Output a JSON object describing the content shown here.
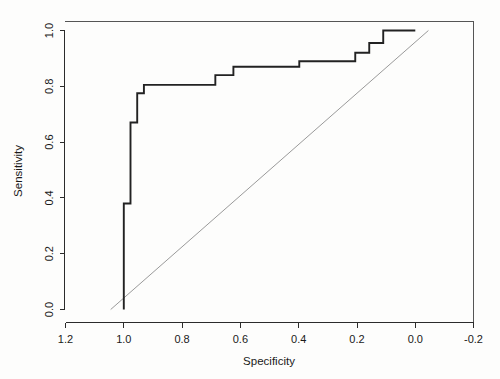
{
  "chart_data": {
    "type": "line",
    "title": "",
    "subtitle": "",
    "xlabel": "Specificity",
    "ylabel": "Sensitivity",
    "xlim": [
      1.3,
      -0.25
    ],
    "ylim": [
      -0.05,
      1.06
    ],
    "x_reversed": true,
    "grid": false,
    "legend": null,
    "legend_position": "none",
    "xticks": [
      "1.2",
      "1.0",
      "0.8",
      "0.6",
      "0.4",
      "0.2",
      "0.0",
      "-0.2"
    ],
    "xtick_values": [
      1.2,
      1.0,
      0.8,
      0.6,
      0.4,
      0.2,
      0.0,
      -0.2
    ],
    "yticks": [
      "0.0",
      "0.2",
      "0.4",
      "0.6",
      "0.8",
      "1.0"
    ],
    "ytick_values": [
      0.0,
      0.2,
      0.4,
      0.6,
      0.8,
      1.0
    ],
    "series": [
      {
        "name": "ROC curve",
        "style": "step",
        "color": "#222222",
        "points": [
          [
            1.0,
            0.0
          ],
          [
            1.0,
            0.38
          ],
          [
            0.977,
            0.38
          ],
          [
            0.977,
            0.67
          ],
          [
            0.977,
            0.67
          ],
          [
            0.954,
            0.67
          ],
          [
            0.954,
            0.775
          ],
          [
            0.931,
            0.775
          ],
          [
            0.931,
            0.805
          ],
          [
            0.88,
            0.805
          ],
          [
            0.88,
            0.805
          ],
          [
            0.686,
            0.805
          ],
          [
            0.686,
            0.84
          ],
          [
            0.624,
            0.84
          ],
          [
            0.624,
            0.87
          ],
          [
            0.398,
            0.87
          ],
          [
            0.398,
            0.89
          ],
          [
            0.206,
            0.89
          ],
          [
            0.206,
            0.92
          ],
          [
            0.158,
            0.92
          ],
          [
            0.158,
            0.955
          ],
          [
            0.11,
            0.955
          ],
          [
            0.11,
            1.0
          ],
          [
            0.0,
            1.0
          ]
        ]
      },
      {
        "name": "chance diagonal",
        "style": "line",
        "color": "#9a9a9a",
        "points": [
          [
            1.045,
            0.0
          ],
          [
            -0.045,
            1.0
          ]
        ]
      }
    ]
  },
  "axes": {
    "x_axis_title": "Specificity",
    "y_axis_title": "Sensitivity"
  }
}
